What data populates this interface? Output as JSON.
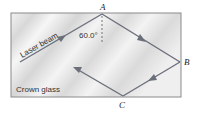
{
  "figure": {
    "material_label": "Crown glass",
    "beam_label": "Laser beam",
    "angle_label": "60.0°",
    "points": [
      {
        "id": "A",
        "label": "A"
      },
      {
        "id": "B",
        "label": "B"
      },
      {
        "id": "C",
        "label": "C"
      }
    ],
    "colors": {
      "glass_fill": "#e4e4e4",
      "glass_border": "#8a8a8a",
      "beam": "#6b6f7a",
      "dashed_normal": "#555555",
      "text": "#222222"
    }
  }
}
